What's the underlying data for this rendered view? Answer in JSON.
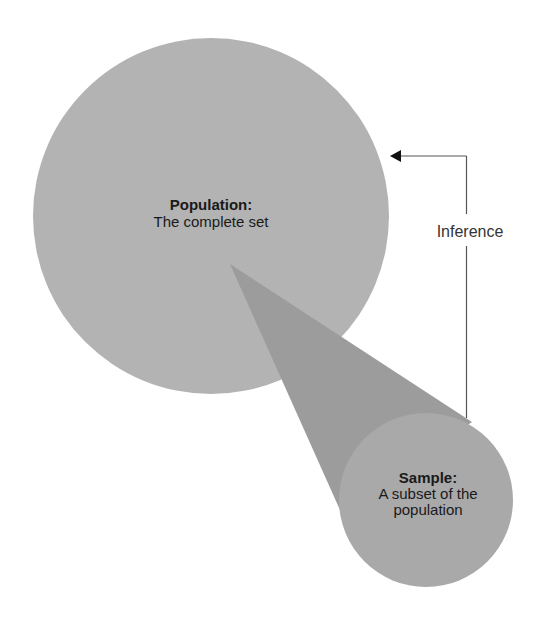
{
  "diagram": {
    "population": {
      "title": "Population:",
      "subtitle": "The complete set",
      "color": "#b3b3b3"
    },
    "sample": {
      "title": "Sample:",
      "line1": "A subset of the",
      "line2": "population",
      "color": "#a9a9a9"
    },
    "cone": {
      "color": "#9c9c9c"
    },
    "inference": {
      "label": "Inference",
      "line_color": "#555555",
      "arrow_color": "#111111"
    }
  }
}
